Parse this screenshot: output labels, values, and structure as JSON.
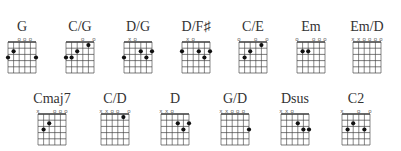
{
  "chord_chart": {
    "rows": [
      {
        "chords": [
          {
            "name": "G",
            "x": 0,
            "y": 20,
            "markers": [
              "",
              "",
              "o",
              "o",
              "o",
              ""
            ],
            "dots": [
              [
                6,
                3
              ],
              [
                5,
                2
              ],
              [
                1,
                3
              ]
            ]
          },
          {
            "name": "C/G",
            "x": 58,
            "y": 20,
            "markers": [
              "",
              "",
              "",
              "o",
              "",
              "o"
            ],
            "dots": [
              [
                6,
                3
              ],
              [
                5,
                3
              ],
              [
                4,
                2
              ],
              [
                2,
                1
              ]
            ]
          },
          {
            "name": "D/G",
            "x": 116,
            "y": 20,
            "markers": [
              "",
              "x",
              "o",
              "",
              "",
              ""
            ],
            "dots": [
              [
                6,
                3
              ],
              [
                3,
                2
              ],
              [
                2,
                3
              ],
              [
                1,
                2
              ]
            ]
          },
          {
            "name": "D/F♯",
            "x": 174,
            "y": 20,
            "markers": [
              "",
              "x",
              "o",
              "",
              "",
              ""
            ],
            "dots": [
              [
                6,
                2
              ],
              [
                3,
                2
              ],
              [
                2,
                3
              ],
              [
                1,
                2
              ]
            ]
          },
          {
            "name": "C/E",
            "x": 231,
            "y": 20,
            "markers": [
              "o",
              "",
              "",
              "o",
              "",
              "o"
            ],
            "dots": [
              [
                5,
                3
              ],
              [
                4,
                2
              ],
              [
                2,
                1
              ]
            ]
          },
          {
            "name": "Em",
            "x": 289,
            "y": 20,
            "markers": [
              "o",
              "",
              "",
              "o",
              "o",
              "o"
            ],
            "dots": [
              [
                5,
                2
              ],
              [
                4,
                2
              ]
            ]
          },
          {
            "name": "Em/D",
            "x": 345,
            "y": 20,
            "markers": [
              "x",
              "x",
              "o",
              "o",
              "o",
              "o"
            ],
            "dots": []
          }
        ]
      },
      {
        "chords": [
          {
            "name": "Cmaj7",
            "x": 30,
            "y": 92,
            "markers": [
              "x",
              "",
              "",
              "o",
              "o",
              "o"
            ],
            "dots": [
              [
                5,
                3
              ],
              [
                4,
                2
              ]
            ]
          },
          {
            "name": "C/D",
            "x": 93,
            "y": 92,
            "markers": [
              "x",
              "x",
              "o",
              "o",
              "",
              "o"
            ],
            "dots": [
              [
                2,
                1
              ]
            ]
          },
          {
            "name": "D",
            "x": 153,
            "y": 92,
            "markers": [
              "x",
              "x",
              "o",
              "",
              "",
              ""
            ],
            "dots": [
              [
                3,
                2
              ],
              [
                2,
                3
              ],
              [
                1,
                2
              ]
            ]
          },
          {
            "name": "G/D",
            "x": 213,
            "y": 92,
            "markers": [
              "x",
              "x",
              "o",
              "o",
              "o",
              ""
            ],
            "dots": [
              [
                1,
                3
              ]
            ]
          },
          {
            "name": "Dsus",
            "x": 273,
            "y": 92,
            "markers": [
              "x",
              "x",
              "o",
              "",
              "",
              ""
            ],
            "dots": [
              [
                3,
                2
              ],
              [
                2,
                3
              ],
              [
                1,
                3
              ]
            ]
          },
          {
            "name": "C2",
            "x": 334,
            "y": 92,
            "markers": [
              "x",
              "",
              "",
              "o",
              "",
              "o"
            ],
            "dots": [
              [
                5,
                3
              ],
              [
                4,
                2
              ],
              [
                2,
                3
              ]
            ]
          }
        ]
      }
    ]
  }
}
